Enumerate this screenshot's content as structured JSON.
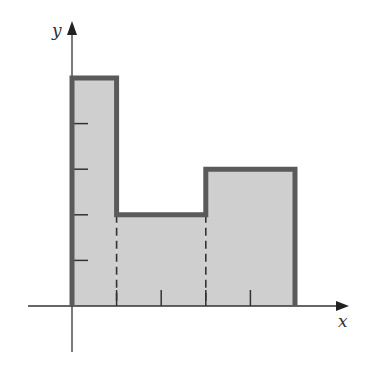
{
  "diagram": {
    "title": "",
    "x_axis_label": "x",
    "y_axis_label": "y",
    "colors": {
      "fill": "#cfcfcf",
      "outline": "#5a5a5a",
      "axis": "#333333",
      "background": "#ffffff"
    },
    "y_ticks": [
      1,
      2,
      3,
      4,
      5
    ],
    "x_ticks": [
      1,
      2,
      3,
      4,
      5
    ],
    "step_function": [
      {
        "x_start": 0,
        "x_end": 1,
        "height": 5
      },
      {
        "x_start": 1,
        "x_end": 3,
        "height": 2
      },
      {
        "x_start": 3,
        "x_end": 5,
        "height": 3
      }
    ],
    "dashed_lines_at_x": [
      1,
      3
    ]
  }
}
